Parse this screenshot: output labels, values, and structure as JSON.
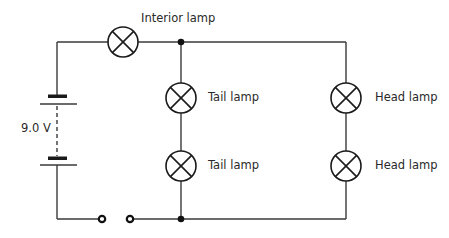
{
  "diagram": {
    "type": "circuit-schematic",
    "colors": {
      "wire": "#3a3a3a",
      "symbol": "#1a1a1a",
      "text": "#2a2a2a",
      "background": "#ffffff"
    },
    "battery": {
      "label": "9.0 V",
      "cells": 2
    },
    "switch": {
      "state": "open"
    },
    "labels": {
      "interior_lamp": "Interior lamp",
      "tail_lamp_1": "Tail lamp",
      "tail_lamp_2": "Tail lamp",
      "head_lamp_1": "Head lamp",
      "head_lamp_2": "Head lamp",
      "battery_voltage": "9.0 V"
    },
    "components": [
      {
        "id": "interior-lamp",
        "kind": "lamp",
        "label": "Interior lamp"
      },
      {
        "id": "tail-lamp-1",
        "kind": "lamp",
        "label": "Tail lamp"
      },
      {
        "id": "tail-lamp-2",
        "kind": "lamp",
        "label": "Tail lamp"
      },
      {
        "id": "head-lamp-1",
        "kind": "lamp",
        "label": "Head lamp"
      },
      {
        "id": "head-lamp-2",
        "kind": "lamp",
        "label": "Head lamp"
      },
      {
        "id": "battery",
        "kind": "battery",
        "label": "9.0 V"
      },
      {
        "id": "switch",
        "kind": "switch",
        "state": "open"
      }
    ]
  }
}
